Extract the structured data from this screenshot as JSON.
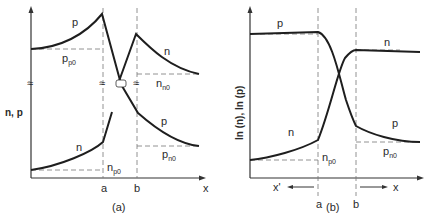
{
  "panel_a": {
    "caption": "(a)",
    "y_axis_label": "n, p",
    "x_axis_label": "x",
    "tick_a": "a",
    "tick_b": "b",
    "curve_labels": {
      "p_upper": "p",
      "n_upper": "n",
      "n_lower": "n",
      "p_lower": "p"
    },
    "levels": {
      "pp0": {
        "main": "p",
        "sub": "p0"
      },
      "nn0": {
        "main": "n",
        "sub": "n0"
      },
      "np0": {
        "main": "n",
        "sub": "p0"
      },
      "pn0": {
        "main": "p",
        "sub": "n0"
      }
    },
    "break_symbol": "≈"
  },
  "panel_b": {
    "caption": "(b)",
    "y_axis_label": "ln (n), ln (p)",
    "x_axis_label": "x",
    "x_prime_label": "x'",
    "tick_a": "a",
    "tick_b": "b",
    "curve_labels": {
      "p_upper": "p",
      "n_upper": "n",
      "n_lower": "n",
      "p_lower": "p"
    },
    "levels": {
      "np0": {
        "main": "n",
        "sub": "p0"
      },
      "pn0": {
        "main": "p",
        "sub": "n0"
      }
    }
  }
}
